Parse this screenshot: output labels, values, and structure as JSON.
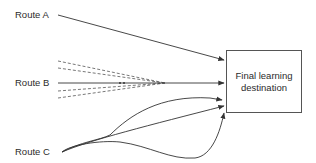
{
  "routes": [
    {
      "id": "A",
      "label": "Route A",
      "style": "straight-solid"
    },
    {
      "id": "B",
      "label": "Route B",
      "style": "straight-with-dashed-fan"
    },
    {
      "id": "C",
      "label": "Route C",
      "style": "curved-looping"
    }
  ],
  "destination": {
    "label": "Final learning destination"
  },
  "colors": {
    "line": "#333333",
    "dashed": "#555555",
    "text": "#2b2b2b",
    "box_border": "#555555",
    "background": "#ffffff"
  }
}
